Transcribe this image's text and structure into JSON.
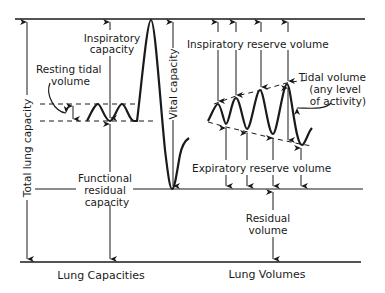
{
  "diagram": {
    "colors": {
      "ink": "#1a1a1a",
      "background": "#ffffff"
    },
    "labels": {
      "inspiratory_capacity_line1": "Inspiratory",
      "inspiratory_capacity_line2": "capacity",
      "resting_tidal_line1": "Resting tidal",
      "resting_tidal_line2": "volume",
      "total_lung_capacity": "Total lung capacity",
      "vital_capacity": "Vital capacity",
      "functional_residual_line1": "Functional",
      "functional_residual_line2": "residual",
      "functional_residual_line3": "capacity",
      "inspiratory_reserve_volume": "Inspiratory reserve volume",
      "tidal_volume_line1": "Tidal volume",
      "tidal_volume_line2": "(any level",
      "tidal_volume_line3": "of activity)",
      "expiratory_reserve_volume": "Expiratory reserve volume",
      "residual_volume_line1": "Residual",
      "residual_volume_line2": "volume"
    },
    "captions": {
      "left": "Lung Capacities",
      "right": "Lung Volumes"
    }
  }
}
